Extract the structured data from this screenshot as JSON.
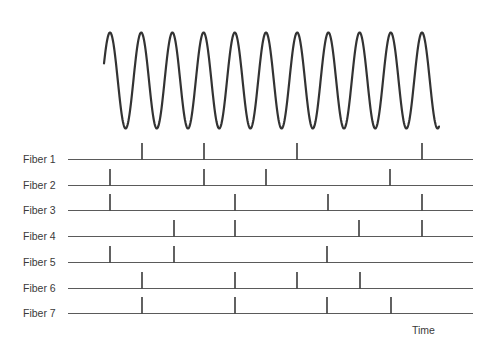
{
  "figure": {
    "time_label": "Time",
    "colors": {
      "wave": "#333333",
      "baseline": "#5a5a5a",
      "spike": "#3a3a3a",
      "text": "#3a3a3a"
    }
  },
  "stimulus": {
    "type": "sine",
    "x_start": 104,
    "x_end": 439,
    "center_y": 80.5,
    "amplitude": 48,
    "period_px": 31.2,
    "first_peak_x": 110,
    "cycles": 11
  },
  "fibers": [
    {
      "label": "Fiber 1",
      "y": 159,
      "spikes": [
        142,
        204,
        297,
        422
      ]
    },
    {
      "label": "Fiber 2",
      "y": 185,
      "spikes": [
        110,
        204,
        266,
        390
      ]
    },
    {
      "label": "Fiber 3",
      "y": 210,
      "spikes": [
        110,
        235,
        328,
        422
      ]
    },
    {
      "label": "Fiber 4",
      "y": 236,
      "spikes": [
        174,
        235,
        359,
        422
      ]
    },
    {
      "label": "Fiber 5",
      "y": 262,
      "spikes": [
        110,
        174,
        327
      ]
    },
    {
      "label": "Fiber 6",
      "y": 288,
      "spikes": [
        142,
        235,
        297,
        360
      ]
    },
    {
      "label": "Fiber 7",
      "y": 313,
      "spikes": [
        142,
        235,
        327,
        391
      ]
    }
  ],
  "axis": {
    "line_x_start": 68,
    "line_x_end": 473,
    "spike_height": 16
  }
}
